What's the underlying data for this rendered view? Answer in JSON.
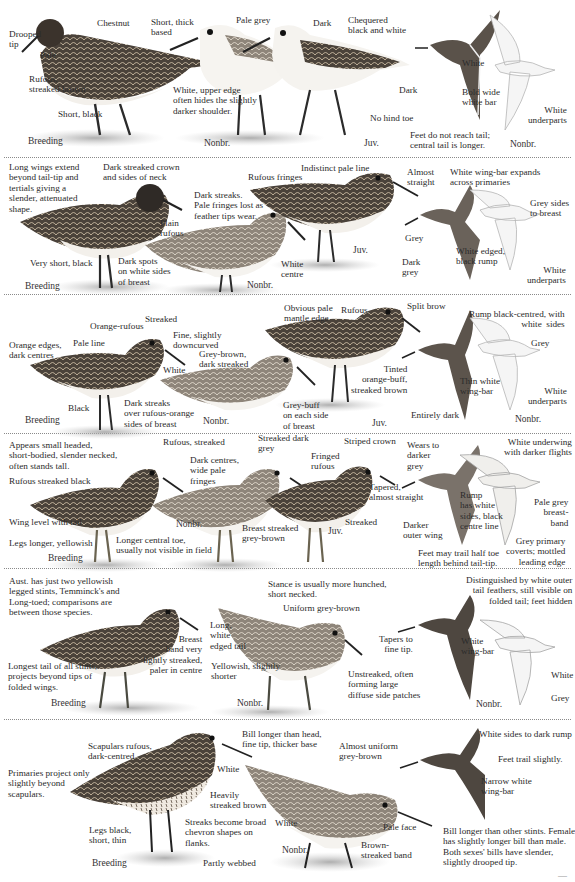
{
  "plate": {
    "background": "#ffffff",
    "divider_color": "#8a8a8a",
    "bird_colors": {
      "dark": "#3a3530",
      "mid": "#7a6f63",
      "light": "#c9c2b6",
      "belly": "#f4f2ee",
      "shadow": "#bdbdbd"
    },
    "rows": [
      {
        "plumages": {
          "breeding": "Breeding",
          "nonbr": "Nonbr.",
          "juv": "Juv.",
          "flight_nonbr": "Nonbr."
        },
        "labels": {
          "chestnut": "Chestnut",
          "drooped_tip": "Drooped\ntip",
          "pale": "Pale",
          "rufous_streaked": "Rufous,\nstreaked brown",
          "short_black": "Short, black",
          "short_thick": "Short, thick\nbased",
          "pale_grey": "Pale grey",
          "white_upper_edge": "White, upper edge\noften hides the slightly\ndarker shoulder.",
          "dark": "Dark",
          "chequered": "Chequered\nblack and white",
          "no_hind_toe": "No hind toe",
          "white": "White",
          "dark_wing": "Dark",
          "bold_white_bar": "Bold wide\nwhite bar",
          "white_underparts": "White\nunderparts",
          "feet_note": "Feet do not reach tail;\ncentral tail is longer."
        }
      },
      {
        "plumages": {
          "breeding": "Breeding",
          "nonbr": "Nonbr.",
          "juv": "Juv."
        },
        "labels": {
          "long_wings": "Long wings extend\nbeyond tail-tip and\ntertials giving a\nslender, attenuated\nshape.",
          "dark_crown": "Dark streaked crown\nand sides of neck",
          "plain_rufous": "Plain\nrufous",
          "very_short_black": "Very short, black",
          "dark_spots": "Dark spots\non white sides\nof breast",
          "dark_streaks": "Dark streaks.\nPale fringes lost as\nfeather tips wear.",
          "white_centre": "White\ncentre",
          "rufous_fringes": "Rufous fringes",
          "indistinct_line": "Indistinct pale line",
          "almost_straight": "Almost\nstraight",
          "wingbar_expands": "White wing-bar expands\nacross primaries",
          "grey": "Grey",
          "dark_grey": "Dark\ngrey",
          "white_edged_rump": "White edged,\nblack rump",
          "grey_sides": "Grey sides\nto breast",
          "white_underparts": "White\nunderparts"
        }
      },
      {
        "plumages": {
          "breeding": "Breeding",
          "nonbr": "Nonbr.",
          "juv": "Juv.",
          "flight_nonbr": "Nonbr."
        },
        "labels": {
          "orange_edges": "Orange edges,\ndark centres",
          "pale_line": "Pale line",
          "orange_rufous": "Orange-rufous",
          "streaked": "Streaked",
          "fine_downcurved": "Fine, slightly\ndowncurved",
          "white": "White",
          "black": "Black",
          "dark_streaks_over": "Dark streaks\nover rufous-orange\nsides of breast",
          "grey_brown": "Grey-brown,\ndark streaked",
          "grey_buff": "Grey-buff\non each side\nof breast",
          "obvious_pale": "Obvious pale\nmantle edge",
          "rufous": "Rufous",
          "split_brow": "Split brow",
          "tinted": "Tinted\norange-buff,\nstreaked brown",
          "thin_wingbar": "Thin white\nwing-bar",
          "entirely_dark": "Entirely dark",
          "rump_black_centred": "Rump black-centred, with\nwhite  sides",
          "grey": "Grey",
          "white_underparts": "White\nunderparts"
        }
      },
      {
        "plumages": {
          "breeding": "Breeding",
          "nonbr": "Nonbr.",
          "juv": "Juv."
        },
        "labels": {
          "appears_small": "Appears small headed,\nshort-bodied, slender necked,\noften stands tall.",
          "rufous_streaked_black": "Rufous streaked black",
          "wing_level": "Wing level with tail",
          "legs_longer": "Legs longer, yellowish",
          "longer_toe": "Longer central toe,\nusually not visible in field",
          "rufous_streaked": "Rufous, streaked",
          "dark_centres": "Dark centres,\nwide pale\nfringes",
          "streaked_dark_grey": "Streaked dark\ngrey",
          "breast_streaked": "Breast streaked\ngrey-brown",
          "fringed_rufous": "Fringed\nrufous",
          "striped_crown": "Striped crown",
          "tapered": "Tapered,\nalmost straight",
          "streaked": "Streaked",
          "wears_darker": "Wears to\ndarker\ngrey",
          "rump_white_sides": "Rump\nhas white\nsides, black\ncentre line",
          "darker_outer": "Darker\nouter wing",
          "feet_trail": "Feet may trail half toe\nlength behind tail-tip.",
          "white_underwing": "White underwing\nwith darker flights",
          "pale_grey_band": "Pale grey\nbreast-\nband",
          "grey_primary": "Grey primary\ncoverts; mottled\nleading edge"
        }
      },
      {
        "plumages": {
          "breeding": "Breeding",
          "nonbr": "Nonbr.",
          "flight_nonbr": "Nonbr."
        },
        "labels": {
          "aust_note": "Aust. has just two yellowish\nlegged stints, Temminck's and\nLong-toed; comparisons are\nbetween those species.",
          "breast_band": "Breast\nband very\nlightly streaked,\npaler in centre",
          "longest_tail": "Longest tail of all stints,\nprojects beyond tips of\nfolded wings.",
          "stance": "Stance is usually more hunched,\nshort necked.",
          "uniform": "Uniform grey-brown",
          "long_white_tail": "Long,\nwhite\nedged tail",
          "yellowish_shorter": "Yellowish, slightly\nshorter",
          "tapers": "Tapers to\nfine tip.",
          "unstreaked": "Unstreaked, often\nforming large\ndiffuse side patches",
          "distinguished": "Distinguished by white outer\ntail feathers, still visible on\nfolded tail; feet hidden",
          "white_wingbar": "White\nwing-bar",
          "white": "White",
          "grey": "Grey"
        }
      },
      {
        "plumages": {
          "breeding": "Breeding",
          "nonbr": "Nonbr."
        },
        "labels": {
          "primaries": "Primaries project only\nslightly beyond\nscapulars.",
          "scapulars": "Scapulars rufous,\ndark-centred",
          "white": "White",
          "heavily": "Heavily\nstreaked brown",
          "streaks_chevron": "Streaks become broad\nchevron shapes on\nflanks.",
          "legs_black": "Legs black,\nshort, thin",
          "partly_webbed": "Partly webbed",
          "bill_longer_head": "Bill longer than head,\nfine tip, thicker base",
          "almost_uniform": "Almost uniform\ngrey-brown",
          "white2": "White",
          "pale_face": "Pale face",
          "brown_band": "Brown-\nstreaked band",
          "white_sides_rump": "White sides to dark rump",
          "feet_trail_slightly": "Feet trail slightly.",
          "narrow_wingbar": "Narrow white\nwing-bar",
          "bill_note": "Bill longer than other stints. Female\nhas slightly longer bill than male.\nBoth sexes' bills have slender,\nslightly drooped tip."
        }
      }
    ],
    "page_number": "—"
  }
}
